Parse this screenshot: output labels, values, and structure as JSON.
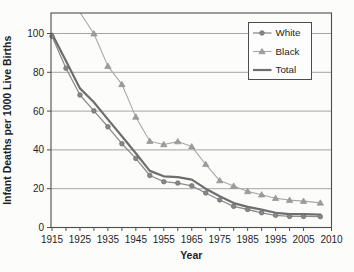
{
  "figure": {
    "background": "#fcfcfb",
    "width": 354,
    "height": 272
  },
  "chart_data": {
    "type": "line",
    "title": "",
    "xlabel": "Year",
    "ylabel": "Infant Deaths per 1000 Live Births",
    "x_tick_labels": [
      "1915",
      "1925",
      "1935",
      "1945",
      "1955",
      "1965",
      "1975",
      "1985",
      "1995",
      "2005",
      "2010"
    ],
    "y_ticks": [
      0,
      20,
      40,
      60,
      80,
      100
    ],
    "ylim": [
      0,
      111
    ],
    "xlim_years": [
      1915,
      2010
    ],
    "grid": "horizontal",
    "colors": {
      "spine": "#4d4d4d",
      "gridline": "#8f8f8f",
      "tick_text": "#1f1f1f",
      "legend_border": "#4d4d4d",
      "legend_fill": "#fdfdfd"
    },
    "legend": {
      "position": "top-right",
      "entries": [
        "White",
        "Black",
        "Total"
      ]
    },
    "series": [
      {
        "name": "White",
        "marker": "circle",
        "color": "#8c8c8c",
        "marker_fill": "#878787",
        "marker_edge": "#6b6b6b",
        "line_width": 1.3,
        "marker_start_index": 0,
        "x": [
          1915,
          1920,
          1925,
          1930,
          1935,
          1940,
          1945,
          1950,
          1955,
          1960,
          1965,
          1970,
          1975,
          1980,
          1985,
          1990,
          1995,
          2000,
          2005,
          2008
        ],
        "y": [
          98.6,
          82.1,
          68.3,
          60.1,
          51.9,
          43.2,
          35.6,
          26.8,
          23.6,
          22.9,
          21.5,
          17.8,
          14.2,
          10.9,
          9.3,
          7.6,
          6.3,
          5.7,
          5.7,
          5.6
        ]
      },
      {
        "name": "Black",
        "marker": "triangle",
        "color": "#a8a8a8",
        "marker_fill": "#9d9d9d",
        "marker_edge": "#8a8a8a",
        "line_width": 1.1,
        "marker_start_index": 1,
        "x": [
          1925,
          1930,
          1935,
          1940,
          1945,
          1950,
          1955,
          1960,
          1965,
          1970,
          1975,
          1980,
          1985,
          1990,
          1995,
          2000,
          2005,
          2008
        ],
        "y": [
          110.8,
          99.9,
          83.2,
          73.8,
          57.0,
          44.5,
          42.8,
          44.3,
          41.7,
          32.6,
          24.2,
          21.4,
          18.6,
          16.9,
          15.1,
          14.1,
          13.6,
          12.7
        ]
      },
      {
        "name": "Total",
        "marker": "none",
        "color": "#6e6e6e",
        "marker_fill": "#6e6e6e",
        "marker_edge": "#6e6e6e",
        "line_width": 2.2,
        "marker_start_index": 0,
        "x": [
          1915,
          1920,
          1925,
          1930,
          1935,
          1940,
          1945,
          1950,
          1955,
          1960,
          1965,
          1970,
          1975,
          1980,
          1985,
          1990,
          1995,
          2000,
          2005,
          2008
        ],
        "y": [
          99.9,
          85.8,
          71.7,
          64.6,
          55.7,
          47.0,
          38.3,
          29.2,
          26.4,
          26.0,
          24.7,
          20.0,
          16.1,
          12.6,
          10.6,
          9.2,
          7.6,
          6.9,
          6.9,
          6.6
        ]
      }
    ]
  }
}
